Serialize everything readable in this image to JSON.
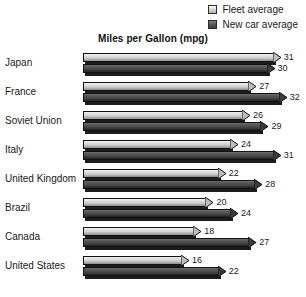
{
  "legend": {
    "items": [
      {
        "label": "Fleet average",
        "swatch": "fleet-swatch-icon",
        "color": "#d0d0d0"
      },
      {
        "label": "New car average",
        "swatch": "newcar-swatch-icon",
        "color": "#4a4a4a"
      }
    ]
  },
  "chart_data": {
    "type": "bar",
    "orientation": "horizontal",
    "title": "Miles per Gallon (mpg)",
    "xlabel": "",
    "ylabel": "",
    "grid": false,
    "legend_position": "top-right",
    "xlim": [
      0,
      33
    ],
    "categories": [
      "Japan",
      "France",
      "Soviet Union",
      "Italy",
      "United Kingdom",
      "Brazil",
      "Canada",
      "United States"
    ],
    "series": [
      {
        "name": "Fleet average",
        "color": "#d0d0d0",
        "values": [
          31,
          27,
          26,
          24,
          22,
          20,
          18,
          16
        ]
      },
      {
        "name": "New car average",
        "color": "#4a4a4a",
        "values": [
          30,
          32,
          29,
          31,
          28,
          24,
          27,
          22
        ]
      }
    ]
  }
}
